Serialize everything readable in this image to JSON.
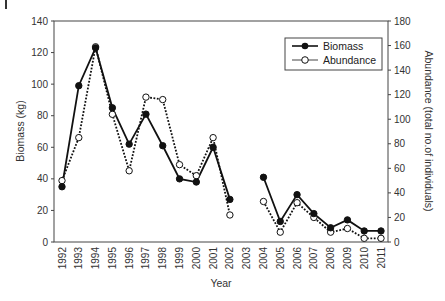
{
  "chart_data": {
    "type": "line",
    "title": "",
    "xlabel": "Year",
    "ylabel": "Biomass (kg)",
    "y2label": "Abundance (total no.of individuals)",
    "x": [
      1992,
      1993,
      1994,
      1995,
      1996,
      1997,
      1998,
      1999,
      2000,
      2001,
      2002,
      2003,
      2004,
      2005,
      2006,
      2007,
      2008,
      2009,
      2010,
      2011
    ],
    "x_tick_labels": [
      "1992",
      "1993",
      "1994",
      "1995",
      "1996",
      "1997",
      "1998",
      "1999",
      "2000",
      "2001",
      "2002",
      "2003",
      "2004",
      "2005",
      "2006",
      "2007",
      "2008",
      "2009",
      "2010",
      "2011"
    ],
    "ylim": [
      0,
      140
    ],
    "y_ticks": [
      0,
      20,
      40,
      60,
      80,
      100,
      120,
      140
    ],
    "y2lim": [
      0,
      180
    ],
    "y2_ticks": [
      0,
      20,
      40,
      60,
      80,
      100,
      120,
      140,
      160,
      180
    ],
    "grid": false,
    "legend_position": "top-right",
    "series": [
      {
        "name": "Biomass",
        "axis": "left",
        "style": "solid",
        "marker": "filled-circle",
        "values": [
          35,
          99,
          123,
          85,
          62,
          81,
          61,
          40,
          38,
          60,
          27,
          null,
          41,
          13,
          30,
          18,
          9,
          14,
          7,
          7
        ]
      },
      {
        "name": "Abundance",
        "axis": "right",
        "style": "dotted",
        "marker": "open-circle",
        "values": [
          50,
          85,
          159,
          104,
          58,
          118,
          116,
          63,
          54,
          85,
          22,
          null,
          33,
          8,
          32,
          20,
          8,
          11,
          3,
          3
        ]
      }
    ]
  },
  "colors": {
    "line": "#111111",
    "axis": "#444444",
    "text": "#333333"
  }
}
